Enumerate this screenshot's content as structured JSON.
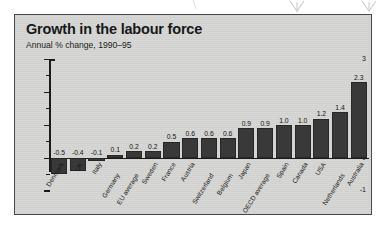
{
  "chart_data": {
    "type": "bar",
    "title": "Growth in the labour force",
    "subtitle": "Annual % change, 1990–95",
    "xlabel": "",
    "ylabel": "",
    "ylim": [
      -1,
      3
    ],
    "yticks": [
      "3",
      "2",
      "1",
      "0",
      "-1"
    ],
    "grid": false,
    "legend": null,
    "bar_color": "#39393a",
    "panel_color": "#d6d6d4",
    "categories": [
      "Denmark",
      "UK",
      "Italy",
      "Germany",
      "EU average",
      "Sweden",
      "France",
      "Austria",
      "Switzerland",
      "Belgium",
      "Japan",
      "OECD average",
      "Spain",
      "Canada",
      "USA",
      "Netherlands",
      "Australia"
    ],
    "values": [
      -0.5,
      -0.4,
      -0.1,
      0.1,
      0.2,
      0.2,
      0.5,
      0.6,
      0.6,
      0.6,
      0.9,
      0.9,
      1.0,
      1.0,
      1.2,
      1.4,
      2.3
    ],
    "value_labels": [
      "-0.5",
      "-0.4",
      "-0.1",
      "0.1",
      "0.2",
      "0.2",
      "0.5",
      "0.6",
      "0.6",
      "0.6",
      "0.9",
      "0.9",
      "1.0",
      "1.0",
      "1.2",
      "1.4",
      "2.3"
    ],
    "label_stagger": [
      0,
      0,
      0,
      1,
      1,
      0,
      0,
      0,
      1,
      1,
      0,
      1,
      0,
      0,
      0,
      1,
      0
    ]
  }
}
